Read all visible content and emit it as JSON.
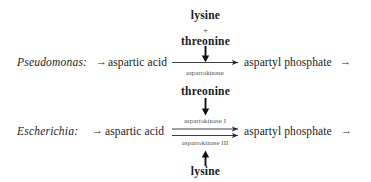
{
  "figure": {
    "type": "biochemical-pathway-diagram",
    "background_color": "#ffffff",
    "text_color": "#1a1a1a",
    "enzyme_label_color": "#4a4a4a"
  },
  "panels": [
    {
      "id": "pseudomonas",
      "organism_label": "Pseudomonas:",
      "lead_arrow": "→",
      "substrate": "aspartic acid",
      "product": "aspartyl phosphate",
      "trailing_arrow": "→",
      "enzymes_above": [],
      "enzymes_below": [
        "aspartokinase"
      ],
      "reaction_arrow_count": 1,
      "inhibitors_above": [
        "lysine",
        "threonine"
      ],
      "inhibitor_separator": "+",
      "inhibitors_below": [],
      "inhibition_arrow_above_direction": "down",
      "inhibition_arrow_below_direction": null
    },
    {
      "id": "escherichia",
      "organism_label": "Escherichia:",
      "lead_arrow": "→",
      "substrate": "aspartic acid",
      "product": "aspartyl phosphate",
      "trailing_arrow": "→",
      "enzymes_above": [
        "aspartokinase I"
      ],
      "enzymes_below": [
        "aspartokinase III"
      ],
      "reaction_arrow_count": 2,
      "inhibitors_above": [
        "threonine"
      ],
      "inhibitor_separator": null,
      "inhibitors_below": [
        "lysine"
      ],
      "inhibition_arrow_above_direction": "down",
      "inhibition_arrow_below_direction": "up"
    }
  ],
  "labels": {
    "top_inhibitor_1": "lysine",
    "top_inhibitor_plus": "+",
    "top_inhibitor_2": "threonine",
    "top_enzyme": "aspartokinase",
    "mid_inhibitor": "threonine",
    "enzyme_isozyme_1": "aspartokinase I",
    "enzyme_isozyme_3": "aspartokinase III",
    "bottom_inhibitor": "lysine",
    "organism_1": "Pseudomonas:",
    "organism_2": "Escherichia:",
    "substrate_1": "aspartic acid",
    "substrate_2": "aspartic acid",
    "product_1": "aspartyl phosphate",
    "product_2": "aspartyl phosphate",
    "arrow_glyph": "→"
  }
}
